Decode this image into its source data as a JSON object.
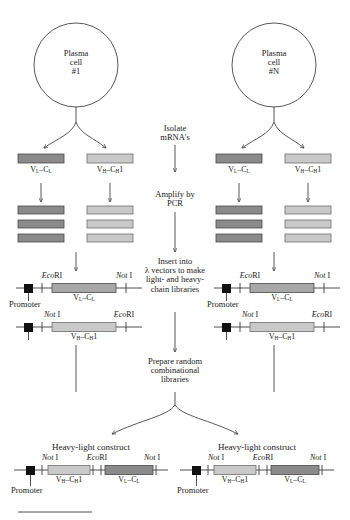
{
  "figure": {
    "colors": {
      "light_segment": "#c9c9c9",
      "dark_segment": "#8a8a8a",
      "stroke": "#3a3a3a",
      "promoter_box": "#111111",
      "background": "#ffffff"
    }
  },
  "cells": {
    "left": {
      "line1": "Plasma",
      "line2": "cell",
      "line3": "#1"
    },
    "right": {
      "line1": "Plasma",
      "line2": "cell",
      "line3": "#N"
    }
  },
  "flow_steps": {
    "isolate": {
      "line1": "Isolate",
      "line2": "mRNA's"
    },
    "amplify": {
      "line1": "Amplify by",
      "line2": "PCR"
    },
    "insert": {
      "line1": "Insert into",
      "line2": "λ vectors to make",
      "line3": "light- and heavy-",
      "line4": "chain libraries"
    },
    "prepare": {
      "line1": "Prepare random",
      "line2": "combinational",
      "line3": "libraries"
    }
  },
  "segments": {
    "light_chain": {
      "label_v": "V",
      "label_v_sub": "L",
      "label_c": "C",
      "label_c_sub": "L",
      "text": "V_L–C_L"
    },
    "heavy_chain": {
      "label_v": "V",
      "label_v_sub": "H",
      "label_c": "C",
      "label_c_sub": "H",
      "suffix": "1",
      "text": "V_H–C_H1"
    }
  },
  "restriction_sites": {
    "eco": {
      "italic": "Eco",
      "roman": "RI"
    },
    "not": {
      "italic": "Not",
      "roman": " I"
    }
  },
  "promoter_label": "Promoter",
  "mrna_row": {
    "left_cell": [
      {
        "type": "light",
        "label": "V_L–C_L"
      },
      {
        "type": "heavy",
        "label": "V_H–C_H1"
      }
    ],
    "right_cell": [
      {
        "type": "light",
        "label": "V_L–C_L"
      },
      {
        "type": "heavy",
        "label": "V_H–C_H1"
      }
    ]
  },
  "pcr_stacks": {
    "bars_per_stack": 3,
    "stacks": 4
  },
  "vector_constructs": {
    "left": [
      {
        "left_site": "EcoRI",
        "right_site": "Not I",
        "segment": "V_L–C_L",
        "shade": "light"
      },
      {
        "left_site": "Not I",
        "right_site": "EcoRI",
        "segment": "V_H–C_H1",
        "shade": "light"
      }
    ],
    "right": [
      {
        "left_site": "EcoRI",
        "right_site": "Not I",
        "segment": "V_L–C_L",
        "shade": "light"
      },
      {
        "left_site": "Not I",
        "right_site": "EcoRI",
        "segment": "V_H–C_H1",
        "shade": "light"
      }
    ]
  },
  "final_constructs": {
    "title": "Heavy-light construct",
    "left": {
      "site1": "Not I",
      "site2": "EcoRI",
      "site3": "Not I",
      "segment1": "V_H–C_H1",
      "segment2": "V_L–C_L",
      "promoter": "Promoter"
    },
    "right": {
      "site1": "Not I",
      "site2": "EcoRI",
      "site3": "Not I",
      "segment1": "V_H–C_H1",
      "segment2": "V_L–C_L",
      "promoter": "Promoter"
    }
  }
}
